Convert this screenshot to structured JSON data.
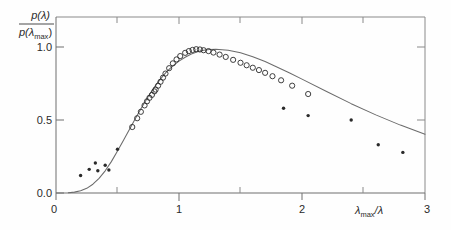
{
  "figure": {
    "background_color": "#fefefe",
    "frame_color": "#7a7a7a",
    "curve_color": "#6b6b6b",
    "marker_color": "#2a2a2a"
  },
  "chart_data": {
    "type": "scatter",
    "title": "",
    "subtitle": "",
    "xlabel": "λ_max/λ",
    "xlabel_base": "λ",
    "xlabel_sub": "max",
    "xlabel_tail": "/λ",
    "ylabel": "p(λ)/p(λ_max)",
    "ylabel_numerator": "p(λ)",
    "ylabel_denominator_base": "p(λ",
    "ylabel_denominator_sub": "max",
    "ylabel_denominator_tail": ")",
    "xlim": [
      0,
      3
    ],
    "ylim": [
      0.0,
      1.08
    ],
    "grid": false,
    "legend": false,
    "x_ticks_major": [
      0,
      1,
      2,
      3
    ],
    "x_tick_labels": [
      "0",
      "1",
      "2",
      "3"
    ],
    "x_ticks_minor": [
      0.5,
      1.5,
      2.5
    ],
    "y_ticks_major": [
      0.0,
      0.5,
      1.0
    ],
    "y_tick_labels": [
      "0.0",
      "0.5",
      "1.0"
    ],
    "series": [
      {
        "name": "theoretical curve",
        "marker": "none",
        "style": "line",
        "x": [
          0.1,
          0.15,
          0.2,
          0.25,
          0.3,
          0.35,
          0.4,
          0.45,
          0.5,
          0.55,
          0.6,
          0.65,
          0.7,
          0.75,
          0.8,
          0.85,
          0.9,
          0.95,
          1.0,
          1.05,
          1.1,
          1.15,
          1.2,
          1.25,
          1.3,
          1.4,
          1.5,
          1.6,
          1.7,
          1.8,
          1.9,
          2.0,
          2.2,
          2.4,
          2.6,
          2.8,
          3.0
        ],
        "y": [
          0.002,
          0.006,
          0.015,
          0.032,
          0.06,
          0.1,
          0.152,
          0.215,
          0.287,
          0.363,
          0.44,
          0.517,
          0.591,
          0.661,
          0.725,
          0.782,
          0.831,
          0.871,
          0.903,
          0.93,
          0.952,
          0.968,
          0.978,
          0.983,
          0.985,
          0.978,
          0.96,
          0.933,
          0.9,
          0.862,
          0.822,
          0.78,
          0.695,
          0.612,
          0.535,
          0.465,
          0.402
        ]
      },
      {
        "name": "open circle measurements",
        "marker": "open-circle",
        "style": "points",
        "x": [
          0.62,
          0.66,
          0.69,
          0.72,
          0.74,
          0.76,
          0.78,
          0.8,
          0.81,
          0.83,
          0.85,
          0.87,
          0.89,
          0.92,
          0.95,
          0.98,
          1.01,
          1.05,
          1.08,
          1.11,
          1.14,
          1.17,
          1.2,
          1.24,
          1.28,
          1.33,
          1.38,
          1.44,
          1.5,
          1.55,
          1.6,
          1.65,
          1.7,
          1.76,
          1.83,
          1.92,
          2.05
        ],
        "y": [
          0.452,
          0.512,
          0.556,
          0.6,
          0.628,
          0.652,
          0.672,
          0.696,
          0.708,
          0.735,
          0.762,
          0.79,
          0.818,
          0.855,
          0.888,
          0.915,
          0.938,
          0.96,
          0.972,
          0.98,
          0.985,
          0.983,
          0.978,
          0.972,
          0.962,
          0.948,
          0.932,
          0.912,
          0.892,
          0.875,
          0.858,
          0.842,
          0.823,
          0.8,
          0.772,
          0.735,
          0.678
        ]
      },
      {
        "name": "filled dot measurements",
        "marker": "filled-dot",
        "style": "points",
        "x": [
          0.2,
          0.27,
          0.32,
          0.34,
          0.4,
          0.43,
          0.5,
          1.85,
          2.05,
          2.4,
          2.62,
          2.82
        ],
        "y": [
          0.12,
          0.162,
          0.205,
          0.152,
          0.19,
          0.158,
          0.3,
          0.58,
          0.53,
          0.5,
          0.33,
          0.278
        ]
      }
    ]
  }
}
